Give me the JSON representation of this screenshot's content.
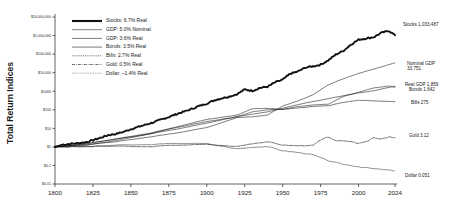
{
  "chart_data": {
    "type": "line",
    "title": "",
    "xlabel": "",
    "ylabel": "Total Return Indices",
    "yscale": "log",
    "ylim": [
      0.01,
      10000000
    ],
    "xlim": [
      1800,
      2024
    ],
    "grid": false,
    "legend_position": "top-left",
    "xticks": [
      "1800",
      "1825",
      "1850",
      "1875",
      "1900",
      "1925",
      "1950",
      "1975",
      "2000",
      "2024"
    ],
    "xtick_values": [
      1800,
      1825,
      1850,
      1875,
      1900,
      1925,
      1950,
      1975,
      2000,
      2024
    ],
    "yticks": [
      "$10,000,000",
      "$1,000,000",
      "$100,000",
      "$10,000",
      "$1000",
      "$100",
      "$10",
      "$1",
      "$0.1",
      "$0.01"
    ],
    "ytick_values": [
      10000000,
      1000000,
      100000,
      10000,
      1000,
      100,
      10,
      1,
      0.1,
      0.01
    ],
    "legend": [
      {
        "label": "Stocks: 6.7% Real",
        "style": "solid-thick"
      },
      {
        "label": "GDP: 5.0% Nominal",
        "style": "solid-thin"
      },
      {
        "label": "GDP: 3.6% Real",
        "style": "solid-thin"
      },
      {
        "label": "Bonds: 3.5% Real",
        "style": "solid-thin"
      },
      {
        "label": "Bills: 2.7% Real",
        "style": "dotted"
      },
      {
        "label": "Gold: 0.5% Real",
        "style": "dash-dot"
      },
      {
        "label": "Dollar: –1.4% Real",
        "style": "fine-dotted"
      }
    ],
    "end_labels": [
      {
        "name": "stocks",
        "text": "Stocks 1,033,487",
        "x": 2024,
        "y": 1033487
      },
      {
        "name": "nominal-gdp",
        "text": "Nominal GDP\n33,751",
        "x": 2024,
        "y": 33751
      },
      {
        "name": "real-gdp",
        "text": "Real GDP 1,859",
        "x": 2024,
        "y": 1859
      },
      {
        "name": "bonds",
        "text": "Bonds 1,642",
        "x": 2024,
        "y": 1642
      },
      {
        "name": "bills",
        "text": "Bills 275",
        "x": 2024,
        "y": 275
      },
      {
        "name": "gold",
        "text": "Gold 3.12",
        "x": 2024,
        "y": 3.12
      },
      {
        "name": "dollar",
        "text": "Dollar 0.051",
        "x": 2024,
        "y": 0.051
      }
    ],
    "series": [
      {
        "name": "Stocks",
        "legend": "Stocks: 6.7% Real",
        "style": "solid-thick",
        "width": 1.9,
        "final_value": 1033487,
        "cagr_real_pct": 6.7,
        "x": [
          1800,
          1805,
          1810,
          1815,
          1820,
          1825,
          1830,
          1835,
          1840,
          1845,
          1850,
          1855,
          1860,
          1865,
          1870,
          1875,
          1880,
          1885,
          1890,
          1895,
          1900,
          1905,
          1910,
          1915,
          1920,
          1925,
          1930,
          1935,
          1940,
          1945,
          1950,
          1955,
          1960,
          1965,
          1970,
          1975,
          1980,
          1985,
          1990,
          1995,
          2000,
          2005,
          2010,
          2015,
          2020,
          2024
        ],
        "y": [
          1,
          1.3,
          1.45,
          1.6,
          1.75,
          2.3,
          3.1,
          4.3,
          5.0,
          6.4,
          9.0,
          12,
          16,
          21,
          30,
          41,
          58,
          80,
          110,
          160,
          215,
          330,
          420,
          520,
          700,
          1250,
          1050,
          1500,
          1750,
          3000,
          4200,
          8800,
          11500,
          19000,
          22000,
          27000,
          46000,
          95000,
          150000,
          330000,
          600000,
          700000,
          820000,
          1400000,
          1800000,
          1033487
        ],
        "y_noise_seed": 7
      },
      {
        "name": "GDP Nominal",
        "legend": "GDP: 5.0% Nominal",
        "style": "solid-thin",
        "width": 0.55,
        "final_value": 33751,
        "cagr_nominal_pct": 5.0,
        "x": [
          1800,
          1820,
          1840,
          1860,
          1880,
          1900,
          1920,
          1930,
          1940,
          1950,
          1960,
          1970,
          1980,
          1990,
          2000,
          2010,
          2020,
          2024
        ],
        "y": [
          1,
          1.3,
          1.9,
          3.2,
          5.6,
          11,
          38,
          42,
          52,
          160,
          300,
          640,
          2200,
          4700,
          9200,
          15500,
          27000,
          33751
        ]
      },
      {
        "name": "GDP Real",
        "legend": "GDP: 3.6% Real",
        "style": "solid-thin",
        "width": 0.55,
        "final_value": 1859,
        "cagr_real_pct": 3.6,
        "x": [
          1800,
          1820,
          1840,
          1860,
          1880,
          1900,
          1920,
          1940,
          1960,
          1980,
          2000,
          2010,
          2020,
          2024
        ],
        "y": [
          1,
          1.5,
          2.6,
          4.6,
          9,
          19,
          43,
          78,
          190,
          400,
          820,
          1050,
          1600,
          1859
        ]
      },
      {
        "name": "Bonds",
        "legend": "Bonds: 3.5% Real",
        "style": "solid-thin",
        "width": 0.55,
        "final_value": 1642,
        "cagr_real_pct": 3.5,
        "x": [
          1800,
          1820,
          1840,
          1860,
          1880,
          1900,
          1920,
          1930,
          1940,
          1950,
          1960,
          1970,
          1980,
          1990,
          2000,
          2010,
          2020,
          2024
        ],
        "y": [
          1,
          1.4,
          2.7,
          5.0,
          11,
          23,
          42,
          78,
          100,
          105,
          150,
          180,
          200,
          520,
          880,
          1500,
          1900,
          1642
        ]
      },
      {
        "name": "Bills",
        "legend": "Bills: 2.7% Real",
        "style": "dotted",
        "width": 0.6,
        "final_value": 275,
        "cagr_real_pct": 2.7,
        "x": [
          1800,
          1820,
          1840,
          1860,
          1880,
          1900,
          1920,
          1930,
          1940,
          1950,
          1960,
          1970,
          1980,
          1990,
          2000,
          2010,
          2020,
          2024
        ],
        "y": [
          1,
          1.2,
          2.2,
          4.5,
          12,
          30,
          52,
          115,
          120,
          105,
          125,
          150,
          165,
          250,
          330,
          300,
          280,
          275
        ]
      },
      {
        "name": "Gold",
        "legend": "Gold: 0.5% Real",
        "style": "dash-dot",
        "width": 0.6,
        "final_value": 3.12,
        "cagr_real_pct": 0.5,
        "x": [
          1800,
          1820,
          1840,
          1860,
          1880,
          1900,
          1920,
          1930,
          1940,
          1950,
          1960,
          1970,
          1975,
          1980,
          1985,
          1990,
          1995,
          2000,
          2005,
          2010,
          2015,
          2020,
          2024
        ],
        "y": [
          1,
          1.05,
          1.1,
          1.0,
          1.25,
          1.35,
          1.05,
          1.5,
          1.9,
          1.25,
          1.15,
          1.2,
          2.4,
          3.4,
          2.2,
          2.1,
          1.9,
          1.55,
          1.9,
          3.2,
          2.6,
          3.4,
          3.12
        ]
      },
      {
        "name": "Dollar",
        "legend": "Dollar: –1.4% Real",
        "style": "fine-dotted",
        "width": 0.55,
        "final_value": 0.051,
        "cagr_real_pct": -1.4,
        "x": [
          1800,
          1820,
          1840,
          1860,
          1880,
          1900,
          1920,
          1930,
          1940,
          1950,
          1960,
          1970,
          1980,
          1990,
          2000,
          2010,
          2020,
          2024
        ],
        "y": [
          1,
          1.0,
          1.25,
          1.3,
          1.55,
          1.5,
          0.78,
          0.95,
          1.05,
          0.62,
          0.5,
          0.38,
          0.18,
          0.115,
          0.085,
          0.067,
          0.056,
          0.051
        ]
      }
    ]
  }
}
